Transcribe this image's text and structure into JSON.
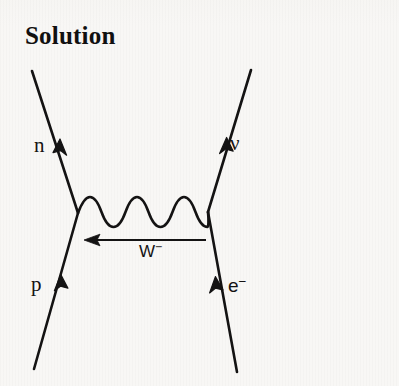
{
  "page": {
    "title": "Solution",
    "background_color": "#f8f7f5",
    "ink_color": "#141313"
  },
  "diagram": {
    "kind": "feynman-diagram",
    "labels": {
      "neutron": "n",
      "neutrino": "ν",
      "proton": "p",
      "electron_base": "e",
      "electron_charge": "−",
      "wboson_base": "W",
      "wboson_charge": "−"
    },
    "vertices": {
      "left": {
        "x": 78,
        "y": 213
      },
      "right": {
        "x": 208,
        "y": 212
      }
    },
    "fermion_lines": [
      {
        "name": "neutron-line",
        "from": {
          "x": 78,
          "y": 213
        },
        "to": {
          "x": 32,
          "y": 71
        },
        "arrow_direction": "outgoing-up-left"
      },
      {
        "name": "proton-line",
        "from": {
          "x": 34,
          "y": 369
        },
        "to": {
          "x": 78,
          "y": 213
        },
        "arrow_direction": "incoming-up-right"
      },
      {
        "name": "neutrino-line",
        "from": {
          "x": 208,
          "y": 212
        },
        "to": {
          "x": 251,
          "y": 70
        },
        "arrow_direction": "outgoing-up-right"
      },
      {
        "name": "electron-line",
        "from": {
          "x": 237,
          "y": 372
        },
        "to": {
          "x": 208,
          "y": 212
        },
        "arrow_direction": "incoming-up-left"
      }
    ],
    "propagator": {
      "name": "w-boson-wavy-line",
      "style": "wavy",
      "from": {
        "x": 78,
        "y": 213
      },
      "to": {
        "x": 208,
        "y": 212
      },
      "wavelength": 31,
      "amplitude": 9,
      "cycles": 4
    },
    "charge_arrow": {
      "name": "w-boson-charge-flow-arrow",
      "from": {
        "x": 206,
        "y": 240
      },
      "to": {
        "x": 86,
        "y": 240
      },
      "direction": "left"
    }
  }
}
